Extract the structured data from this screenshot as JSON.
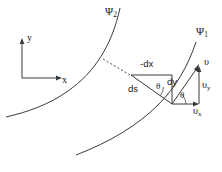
{
  "figure": {
    "background_color": "#ffffff",
    "line_color": "#333333",
    "text_color": "#1a1a1a",
    "width": 222,
    "height": 172
  },
  "axes": {
    "x_label": "x",
    "y_label": "y",
    "origin": {
      "x": 22,
      "y": 78
    },
    "x_tip": {
      "x": 62,
      "y": 78
    },
    "y_tip": {
      "x": 22,
      "y": 40
    }
  },
  "streamlines": [
    {
      "name": "psi-1",
      "label": "Ψ",
      "subscript": "1",
      "label_x": 197,
      "label_y": 32,
      "description": "inner streamline arc passing through the vertex point"
    },
    {
      "name": "psi-2",
      "label": "Ψ",
      "subscript": "2",
      "label_x": 110,
      "label_y": 12,
      "description": "outer streamline arc"
    }
  ],
  "differential_triangle": {
    "vertex": {
      "x": 172,
      "y": 104
    },
    "corner_top_left": {
      "x": 131,
      "y": 76
    },
    "corner_top_right": {
      "x": 172,
      "y": 76
    },
    "labels": {
      "ds": "ds",
      "dx": "-dx",
      "dy": "dy",
      "theta": "θ"
    }
  },
  "velocity_triangle": {
    "vertex": {
      "x": 172,
      "y": 104
    },
    "tip": {
      "x": 199,
      "y": 66
    },
    "corner_right": {
      "x": 199,
      "y": 104
    },
    "labels": {
      "v": "υ",
      "vy": "υ",
      "vy_sub": "y",
      "vx": "υ",
      "vx_sub": "x",
      "theta": "θ"
    }
  },
  "dashed_connector": {
    "from": {
      "x": 104,
      "y": 60
    },
    "to": {
      "x": 131,
      "y": 76
    }
  }
}
